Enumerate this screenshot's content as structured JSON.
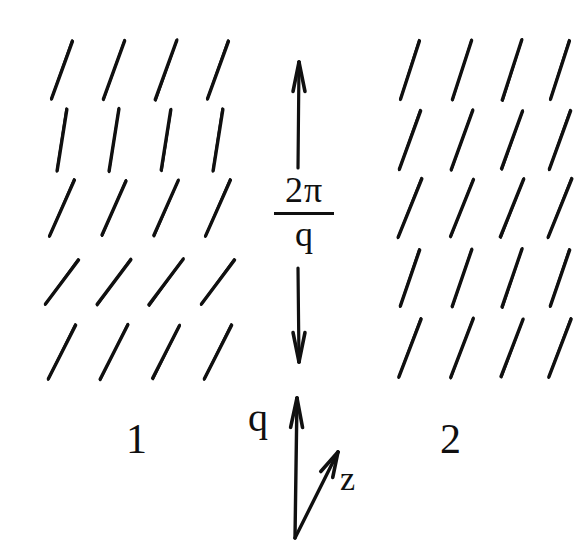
{
  "figure": {
    "type": "diagram",
    "background_color": "#ffffff",
    "ink_color": "#101010",
    "width": 582,
    "height": 560
  },
  "labels": {
    "domain_1": "1",
    "domain_2": "2",
    "q_vector": "q",
    "z_axis": "z",
    "pitch_numerator": "2π",
    "pitch_denominator": "q"
  },
  "pitch_arrow": {
    "name": "pitch-measure-arrow",
    "x": 299,
    "top_y": 62,
    "bottom_y": 362,
    "double_headed": true,
    "gap_top": 168,
    "gap_bottom": 268
  },
  "axes": {
    "origin_x": 295,
    "origin_y": 538,
    "q_arrow": {
      "tip_x": 297,
      "tip_y": 398,
      "label": "q"
    },
    "z_arrow": {
      "tip_x": 338,
      "tip_y": 452,
      "label": "z"
    }
  },
  "domain_1": {
    "name": "domain-1-director-field",
    "label": "1",
    "columns_x": [
      62,
      114,
      166,
      218
    ],
    "rows": [
      {
        "y": 70,
        "angle_deg": 22,
        "length": 62
      },
      {
        "y": 140,
        "angle_deg": 9,
        "length": 62
      },
      {
        "y": 208,
        "angle_deg": 22,
        "length": 60
      },
      {
        "y": 282,
        "angle_deg": 38,
        "length": 56
      },
      {
        "y": 352,
        "angle_deg": 26,
        "length": 60
      }
    ]
  },
  "domain_2": {
    "name": "domain-2-director-field",
    "label": "2",
    "columns_x": [
      410,
      462,
      512,
      560
    ],
    "rows": [
      {
        "y": 70,
        "angle_deg": 20,
        "length": 62
      },
      {
        "y": 140,
        "angle_deg": 20,
        "length": 62
      },
      {
        "y": 208,
        "angle_deg": 20,
        "length": 62
      },
      {
        "y": 278,
        "angle_deg": 20,
        "length": 60
      },
      {
        "y": 348,
        "angle_deg": 20,
        "length": 62
      }
    ]
  }
}
